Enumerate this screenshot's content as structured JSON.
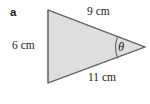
{
  "figure": {
    "part_label": "a",
    "shape": "triangle",
    "fill_color": "#dedede",
    "stroke_color": "#6b6b6b",
    "background_color": "#ffffff",
    "text_color": "#1a1a1a",
    "vertices": {
      "top_left": [
        48,
        10
      ],
      "bottom_left": [
        48,
        83
      ],
      "right": [
        145,
        47
      ]
    },
    "sides": {
      "left": "6 cm",
      "top": "9 cm",
      "bottom": "11 cm"
    },
    "angle": {
      "symbol": "θ",
      "at_vertex": "right",
      "arc_radius": 29
    }
  }
}
